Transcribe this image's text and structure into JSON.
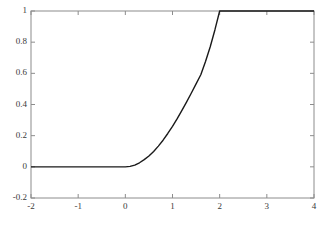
{
  "chart_data": {
    "type": "line",
    "title": "",
    "xlabel": "",
    "ylabel": "",
    "xlim": [
      -2,
      4
    ],
    "ylim": [
      -0.2,
      1
    ],
    "grid": false,
    "legend": null,
    "xticks": [
      -2,
      -1,
      0,
      1,
      2,
      3,
      4
    ],
    "xtick_labels": [
      "-2",
      "-1",
      "0",
      "1",
      "2",
      "3",
      "4"
    ],
    "yticks": [
      -0.2,
      0,
      0.2,
      0.4,
      0.6,
      0.8,
      1
    ],
    "ytick_labels": [
      "-0.2",
      "0",
      "0.2",
      "0.4",
      "0.6",
      "0.8",
      "1"
    ],
    "line_color": "#1a1a1a",
    "line_width": 1.4,
    "axes_color": "#8c8c8c",
    "background_color": "#ffffff",
    "series": [
      {
        "name": "saturating ramp",
        "x": [
          -2.0,
          -1.8,
          -1.6,
          -1.4,
          -1.2,
          -1.0,
          -0.8,
          -0.6,
          -0.4,
          -0.2,
          0.0,
          0.1,
          0.2,
          0.3,
          0.4,
          0.5,
          0.6,
          0.7,
          0.8,
          0.9,
          1.0,
          1.1,
          1.2,
          1.3,
          1.4,
          1.5,
          1.6,
          1.7,
          1.8,
          1.9,
          2.0,
          2.2,
          2.4,
          2.6,
          2.8,
          3.0,
          3.2,
          3.4,
          3.6,
          3.8,
          4.0
        ],
        "y": [
          0.0,
          0.0,
          0.0,
          0.0,
          0.0,
          0.0,
          0.0,
          0.0,
          0.0,
          0.0,
          0.0,
          0.003,
          0.011,
          0.026,
          0.046,
          0.07,
          0.099,
          0.133,
          0.171,
          0.214,
          0.26,
          0.309,
          0.362,
          0.417,
          0.474,
          0.532,
          0.591,
          0.676,
          0.771,
          0.88,
          1.0,
          1.0,
          1.0,
          1.0,
          1.0,
          1.0,
          1.0,
          1.0,
          1.0,
          1.0,
          1.0
        ]
      }
    ]
  },
  "axes_geometry": {
    "left": 31,
    "right": 314,
    "top": 11,
    "bottom": 198
  }
}
